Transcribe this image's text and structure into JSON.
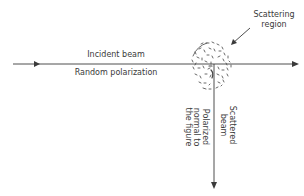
{
  "diagram": {
    "incident_beam": {
      "label": "Incident beam",
      "sublabel": "Random polarization"
    },
    "scattering_region": {
      "label_line1": "Scattering",
      "label_line2": "region"
    },
    "scattered_beam": {
      "label_line1": "Scattered",
      "label_line2": "beam",
      "polarization_line1": "Polarized",
      "polarization_line2": "normal to",
      "polarization_line3": "the figure"
    },
    "colors": {
      "line": "#3a3a3a",
      "text": "#3a3a3a",
      "background": "#ffffff"
    }
  }
}
